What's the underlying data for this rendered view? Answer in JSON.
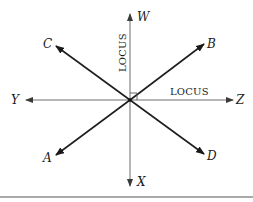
{
  "diagram": {
    "center": {
      "x": 130,
      "y": 100
    },
    "axes": [
      {
        "id": "W",
        "label": "W",
        "direction": "up"
      },
      {
        "id": "X",
        "label": "X",
        "direction": "down"
      },
      {
        "id": "Y",
        "label": "Y",
        "direction": "left"
      },
      {
        "id": "Z",
        "label": "Z",
        "direction": "right"
      }
    ],
    "diagonals": [
      {
        "id": "A",
        "label": "A",
        "direction": "down-left"
      },
      {
        "id": "B",
        "label": "B",
        "direction": "up-right"
      },
      {
        "id": "C",
        "label": "C",
        "direction": "up-left"
      },
      {
        "id": "D",
        "label": "D",
        "direction": "down-right"
      }
    ],
    "locus_labels": {
      "vertical": "LOCUS",
      "horizontal": "LOCUS"
    },
    "right_angle_marker": true,
    "colors": {
      "axis_line": "#6e6e6e",
      "diagonal_line": "#1e1e1e",
      "text": "#1a1a1a",
      "rule": "#555555"
    }
  }
}
